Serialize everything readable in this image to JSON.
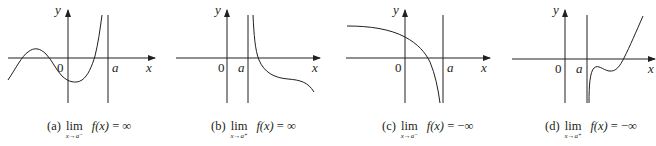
{
  "figure": {
    "panels": [
      {
        "id": "a",
        "axis_labels": {
          "y": "y",
          "x": "x",
          "origin": "0",
          "a": "a"
        },
        "caption": {
          "tag": "(a)",
          "lim": "lim",
          "sub": "x→a⁻",
          "expr": "f(x)",
          "eq": " = ",
          "value": "∞"
        },
        "description": "Function rises to +infinity as x approaches a from the left"
      },
      {
        "id": "b",
        "axis_labels": {
          "y": "y",
          "x": "x",
          "origin": "0",
          "a": "a"
        },
        "caption": {
          "tag": "(b)",
          "lim": "lim",
          "sub": "x→a⁺",
          "expr": "f(x)",
          "eq": " = ",
          "value": "∞"
        },
        "description": "Function rises to +infinity as x approaches a from the right"
      },
      {
        "id": "c",
        "axis_labels": {
          "y": "y",
          "x": "x",
          "origin": "0",
          "a": "a"
        },
        "caption": {
          "tag": "(c)",
          "lim": "lim",
          "sub": "x→a⁻",
          "expr": "f(x)",
          "eq": " = ",
          "value": "−∞"
        },
        "description": "Function falls to -infinity as x approaches a from the left"
      },
      {
        "id": "d",
        "axis_labels": {
          "y": "y",
          "x": "x",
          "origin": "0",
          "a": "a"
        },
        "caption": {
          "tag": "(d)",
          "lim": "lim",
          "sub": "x→a⁺",
          "expr": "f(x)",
          "eq": " = ",
          "value": "−∞"
        },
        "description": "Function falls to -infinity as x approaches a from the right"
      }
    ]
  }
}
